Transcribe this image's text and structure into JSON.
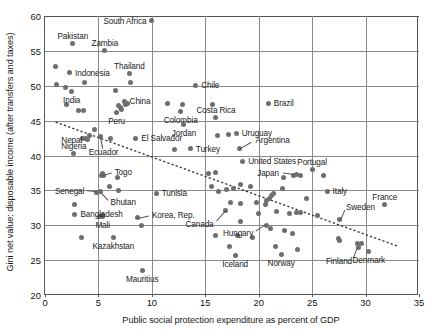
{
  "chart_data": {
    "type": "scatter",
    "title": "",
    "xlabel": "Public social protection expenditure as percent of GDP",
    "ylabel": "Gini net value: disposable income (after transfers and taxes)",
    "xlim": [
      0,
      35
    ],
    "ylim": [
      20,
      60
    ],
    "xticks": [
      0,
      5,
      10,
      15,
      20,
      25,
      30,
      35
    ],
    "yticks": [
      20,
      25,
      30,
      35,
      40,
      45,
      50,
      55,
      60
    ],
    "grid": true,
    "legend": "none",
    "trendline": {
      "type": "linear-dashed",
      "x0": 1.0,
      "y0": 44.8,
      "x1": 33.0,
      "y1": 27.0
    },
    "points": [
      {
        "label": "South Africa",
        "x": 10.0,
        "y": 59.3,
        "pos": "l"
      },
      {
        "label": "Pakistan",
        "x": 2.6,
        "y": 56.1,
        "pos": "t"
      },
      {
        "label": "Zambia",
        "x": 5.6,
        "y": 55.0,
        "pos": "t"
      },
      {
        "label": "Indonesia",
        "x": 2.3,
        "y": 51.9,
        "pos": "r"
      },
      {
        "label": "Thailand",
        "x": 7.9,
        "y": 51.8,
        "pos": "t"
      },
      {
        "label": "Chile",
        "x": 14.1,
        "y": 50.1,
        "pos": "r"
      },
      {
        "label": "India",
        "x": 2.5,
        "y": 49.2,
        "pos": "b"
      },
      {
        "label": "China",
        "x": 7.4,
        "y": 47.8,
        "pos": "r"
      },
      {
        "label": "Costa Rica",
        "x": 16.0,
        "y": 45.5,
        "pos": "t"
      },
      {
        "label": "Brazil",
        "x": 20.9,
        "y": 47.5,
        "pos": "r"
      },
      {
        "label": "Colombia",
        "x": 12.7,
        "y": 46.3,
        "pos": "b"
      },
      {
        "label": "Peru",
        "x": 6.7,
        "y": 46.2,
        "pos": "b"
      },
      {
        "label": "Jordan",
        "x": 13.0,
        "y": 44.4,
        "pos": "b"
      },
      {
        "label": "El Salvador",
        "x": 8.5,
        "y": 42.5,
        "pos": "r"
      },
      {
        "label": "Uruguay",
        "x": 17.9,
        "y": 43.2,
        "pos": "r"
      },
      {
        "label": "Argentina",
        "x": 18.2,
        "y": 41.0,
        "pos": "leader"
      },
      {
        "label": "Turkey",
        "x": 13.6,
        "y": 41.0,
        "pos": "r"
      },
      {
        "label": "Nepal",
        "x": 4.0,
        "y": 42.3,
        "pos": "l"
      },
      {
        "label": "Ecuador",
        "x": 5.2,
        "y": 42.7,
        "pos": "leader"
      },
      {
        "label": "United States",
        "x": 18.5,
        "y": 39.2,
        "pos": "r"
      },
      {
        "label": "Nigeria",
        "x": 2.7,
        "y": 40.3,
        "pos": "t"
      },
      {
        "label": "Togo",
        "x": 5.3,
        "y": 37.2,
        "pos": "leader"
      },
      {
        "label": "Portugal",
        "x": 25.0,
        "y": 38.0,
        "pos": "t"
      },
      {
        "label": "Senegal",
        "x": 4.8,
        "y": 34.7,
        "pos": "leader"
      },
      {
        "label": "Japan",
        "x": 23.3,
        "y": 37.2,
        "pos": "leader"
      },
      {
        "label": "Bhutan",
        "x": 5.2,
        "y": 34.8,
        "pos": "leader"
      },
      {
        "label": "Tunisia",
        "x": 10.4,
        "y": 34.6,
        "pos": "r"
      },
      {
        "label": "Italy",
        "x": 26.4,
        "y": 34.9,
        "pos": "r"
      },
      {
        "label": "France",
        "x": 31.8,
        "y": 33.0,
        "pos": "t"
      },
      {
        "label": "Korea, Rep.",
        "x": 8.7,
        "y": 31.1,
        "pos": "leader"
      },
      {
        "label": "Bangladesh",
        "x": 2.8,
        "y": 31.6,
        "pos": "r"
      },
      {
        "label": "Mali",
        "x": 5.4,
        "y": 31.2,
        "pos": "b"
      },
      {
        "label": "Sweden",
        "x": 27.6,
        "y": 30.8,
        "pos": "leader"
      },
      {
        "label": "Canada",
        "x": 16.9,
        "y": 32.1,
        "pos": "leader"
      },
      {
        "label": "Hungary",
        "x": 20.7,
        "y": 30.0,
        "pos": "leader"
      },
      {
        "label": "Kazakhstan",
        "x": 6.4,
        "y": 28.3,
        "pos": "b"
      },
      {
        "label": "Finland",
        "x": 29.3,
        "y": 26.8,
        "pos": "leader"
      },
      {
        "label": "Denmark",
        "x": 30.3,
        "y": 26.3,
        "pos": "b"
      },
      {
        "label": "Iceland",
        "x": 17.8,
        "y": 25.6,
        "pos": "b"
      },
      {
        "label": "Norway",
        "x": 22.1,
        "y": 25.8,
        "pos": "b"
      },
      {
        "label": "Mauritius",
        "x": 9.1,
        "y": 23.5,
        "pos": "b"
      }
    ],
    "unlabeled_points": [
      {
        "x": 1.0,
        "y": 52.7
      },
      {
        "x": 1.1,
        "y": 50.2
      },
      {
        "x": 1.9,
        "y": 49.7
      },
      {
        "x": 3.7,
        "y": 50.5
      },
      {
        "x": 2.0,
        "y": 47.3
      },
      {
        "x": 3.1,
        "y": 46.5
      },
      {
        "x": 3.6,
        "y": 46.5
      },
      {
        "x": 6.6,
        "y": 49.3
      },
      {
        "x": 8.0,
        "y": 50.4
      },
      {
        "x": 11.5,
        "y": 47.5
      },
      {
        "x": 12.9,
        "y": 47.3
      },
      {
        "x": 15.7,
        "y": 47.3
      },
      {
        "x": 6.9,
        "y": 47.2
      },
      {
        "x": 7.1,
        "y": 46.9
      },
      {
        "x": 7.5,
        "y": 47.3
      },
      {
        "x": 7.7,
        "y": 47.5
      },
      {
        "x": 7.2,
        "y": 46.6
      },
      {
        "x": 16.1,
        "y": 42.9
      },
      {
        "x": 4.6,
        "y": 43.7
      },
      {
        "x": 6.1,
        "y": 42.4
      },
      {
        "x": 3.5,
        "y": 42.4
      },
      {
        "x": 3.8,
        "y": 42.5
      },
      {
        "x": 4.2,
        "y": 42.8
      },
      {
        "x": 17.2,
        "y": 43.0
      },
      {
        "x": 12.1,
        "y": 40.9
      },
      {
        "x": 16.0,
        "y": 37.5
      },
      {
        "x": 5.4,
        "y": 37.4
      },
      {
        "x": 5.5,
        "y": 37.1
      },
      {
        "x": 6.8,
        "y": 36.8
      },
      {
        "x": 6.0,
        "y": 35.5
      },
      {
        "x": 6.9,
        "y": 35.0
      },
      {
        "x": 15.6,
        "y": 35.6
      },
      {
        "x": 16.2,
        "y": 34.9
      },
      {
        "x": 17.0,
        "y": 35.1
      },
      {
        "x": 17.6,
        "y": 35.3
      },
      {
        "x": 18.3,
        "y": 35.9
      },
      {
        "x": 15.3,
        "y": 37.4
      },
      {
        "x": 19.2,
        "y": 35.6
      },
      {
        "x": 22.3,
        "y": 36.9
      },
      {
        "x": 23.5,
        "y": 37.3
      },
      {
        "x": 23.9,
        "y": 37.2
      },
      {
        "x": 26.1,
        "y": 37.2
      },
      {
        "x": 21.2,
        "y": 34.3
      },
      {
        "x": 21.4,
        "y": 34.5
      },
      {
        "x": 21.0,
        "y": 33.8
      },
      {
        "x": 20.7,
        "y": 33.5
      },
      {
        "x": 20.6,
        "y": 33.0
      },
      {
        "x": 22.2,
        "y": 35.3
      },
      {
        "x": 17.4,
        "y": 33.3
      },
      {
        "x": 18.3,
        "y": 33.1
      },
      {
        "x": 2.8,
        "y": 33.0
      },
      {
        "x": 21.7,
        "y": 31.9
      },
      {
        "x": 22.9,
        "y": 31.7
      },
      {
        "x": 23.5,
        "y": 31.8
      },
      {
        "x": 23.9,
        "y": 31.8
      },
      {
        "x": 25.5,
        "y": 31.4
      },
      {
        "x": 20.0,
        "y": 31.7
      },
      {
        "x": 9.0,
        "y": 30.0
      },
      {
        "x": 3.4,
        "y": 28.3
      },
      {
        "x": 5.1,
        "y": 31.3
      },
      {
        "x": 5.4,
        "y": 31.4
      },
      {
        "x": 18.3,
        "y": 30.6
      },
      {
        "x": 21.1,
        "y": 29.5
      },
      {
        "x": 22.4,
        "y": 29.3
      },
      {
        "x": 23.2,
        "y": 28.8
      },
      {
        "x": 16.0,
        "y": 28.5
      },
      {
        "x": 18.0,
        "y": 28.6
      },
      {
        "x": 19.4,
        "y": 28.3
      },
      {
        "x": 17.3,
        "y": 27.0
      },
      {
        "x": 21.6,
        "y": 26.9
      },
      {
        "x": 23.6,
        "y": 26.5
      },
      {
        "x": 27.5,
        "y": 28.1
      },
      {
        "x": 27.6,
        "y": 27.8
      },
      {
        "x": 29.2,
        "y": 27.4
      },
      {
        "x": 29.6,
        "y": 27.4
      },
      {
        "x": 24.5,
        "y": 33.8
      },
      {
        "x": 19.8,
        "y": 33.2
      }
    ]
  }
}
